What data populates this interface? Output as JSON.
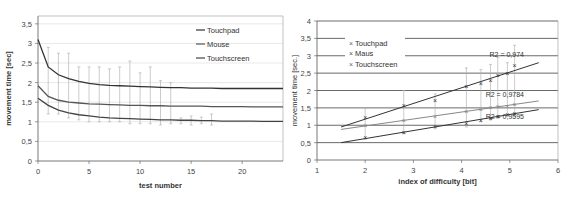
{
  "chart_data": [
    {
      "type": "line",
      "title": "",
      "xlabel": "test number",
      "ylabel": "movement time [sec]",
      "xlim": [
        0,
        24
      ],
      "ylim": [
        0,
        3.7
      ],
      "x_ticks": [
        "0",
        "5",
        "10",
        "15",
        "20"
      ],
      "y_ticks": [
        "0",
        "0,5",
        "1",
        "1,5",
        "2",
        "2,5",
        "3",
        "3,5"
      ],
      "grid": true,
      "legend_position": "top-right inside",
      "legend": [
        "Touchpad",
        "Mouse",
        "Touchscreen"
      ],
      "x": [
        0,
        1,
        2,
        3,
        4,
        5,
        6,
        7,
        8,
        9,
        10,
        11,
        12,
        13,
        14,
        15,
        16,
        17,
        18,
        19,
        20,
        21,
        22,
        23,
        24
      ],
      "series": [
        {
          "name": "Touchpad",
          "values": [
            3.1,
            2.4,
            2.2,
            2.1,
            2.03,
            1.98,
            1.95,
            1.93,
            1.92,
            1.91,
            1.9,
            1.89,
            1.88,
            1.87,
            1.87,
            1.86,
            1.86,
            1.86,
            1.85,
            1.85,
            1.85,
            1.85,
            1.85,
            1.85,
            1.85
          ]
        },
        {
          "name": "Mouse",
          "values": [
            1.92,
            1.65,
            1.55,
            1.5,
            1.48,
            1.46,
            1.45,
            1.44,
            1.43,
            1.42,
            1.42,
            1.41,
            1.41,
            1.4,
            1.4,
            1.4,
            1.4,
            1.39,
            1.39,
            1.39,
            1.39,
            1.38,
            1.38,
            1.38,
            1.38
          ]
        },
        {
          "name": "Touchscreen",
          "values": [
            1.6,
            1.42,
            1.3,
            1.23,
            1.18,
            1.15,
            1.12,
            1.1,
            1.09,
            1.08,
            1.07,
            1.06,
            1.05,
            1.05,
            1.04,
            1.04,
            1.03,
            1.03,
            1.02,
            1.02,
            1.02,
            1.02,
            1.01,
            1.01,
            1.01
          ]
        }
      ],
      "error_bars": [
        {
          "x": 1,
          "low": 1.2,
          "high": 2.9
        },
        {
          "x": 2,
          "low": 1.2,
          "high": 2.75
        },
        {
          "x": 3,
          "low": 1.1,
          "high": 2.75
        },
        {
          "x": 4,
          "low": 1.05,
          "high": 2.4
        },
        {
          "x": 5,
          "low": 1.0,
          "high": 2.4
        },
        {
          "x": 6,
          "low": 1.0,
          "high": 2.4
        },
        {
          "x": 7,
          "low": 1.0,
          "high": 2.35
        },
        {
          "x": 8,
          "low": 1.0,
          "high": 2.4
        },
        {
          "x": 9,
          "low": 0.95,
          "high": 2.55
        },
        {
          "x": 10,
          "low": 0.95,
          "high": 2.25
        },
        {
          "x": 11,
          "low": 0.95,
          "high": 2.4
        },
        {
          "x": 12,
          "low": 0.92,
          "high": 2.05
        },
        {
          "x": 13,
          "low": 0.95,
          "high": 2.0
        },
        {
          "x": 14,
          "low": 0.95,
          "high": 1.1
        },
        {
          "x": 15,
          "low": 0.92,
          "high": 1.15
        },
        {
          "x": 16,
          "low": 0.95,
          "high": 1.12
        },
        {
          "x": 17,
          "low": 0.92,
          "high": 1.2
        }
      ]
    },
    {
      "type": "scatter",
      "title": "",
      "xlabel": "index of difficulty [bit]",
      "ylabel": "movement time [sec.]",
      "xlim": [
        1,
        6
      ],
      "ylim": [
        0,
        4
      ],
      "x_ticks": [
        "1",
        "2",
        "3",
        "4",
        "5",
        "6"
      ],
      "y_ticks": [
        "0",
        "0,5",
        "1",
        "1,5",
        "2",
        "2,5",
        "3",
        "3,5",
        "4"
      ],
      "grid": true,
      "legend_position": "top-left inside",
      "legend": [
        "Touchpad",
        "Maus",
        "Touchscreen"
      ],
      "x": [
        2.0,
        2.8,
        3.45,
        4.1,
        4.4,
        4.6,
        4.75,
        4.95,
        5.1
      ],
      "series": [
        {
          "name": "Touchpad",
          "values": [
            1.22,
            1.58,
            1.72,
            2.12,
            2.2,
            2.3,
            2.42,
            2.48,
            2.72
          ],
          "trendline": {
            "x": [
              1.5,
              5.6
            ],
            "y": [
              0.95,
              2.8
            ]
          },
          "r2_label": "R2 = 0,974",
          "r2": 0.974
        },
        {
          "name": "Maus",
          "values": [
            0.98,
            1.15,
            1.25,
            1.4,
            1.45,
            1.5,
            1.55,
            1.55,
            1.6
          ],
          "trendline": {
            "x": [
              1.5,
              5.6
            ],
            "y": [
              0.88,
              1.7
            ]
          },
          "r2_label": "R2 = 0,9784",
          "r2": 0.9784
        },
        {
          "name": "Touchscreen",
          "values": [
            0.65,
            0.8,
            0.95,
            1.05,
            1.15,
            1.2,
            1.25,
            1.3,
            1.35
          ],
          "trendline": {
            "x": [
              1.5,
              5.6
            ],
            "y": [
              0.5,
              1.45
            ]
          },
          "r2_label": "R2 = 0,9595",
          "r2": 0.9595
        }
      ],
      "error_bars": [
        {
          "x": 2.0,
          "low": 0.6,
          "high": 1.5
        },
        {
          "x": 2.8,
          "low": 0.75,
          "high": 2.0
        },
        {
          "x": 3.45,
          "low": 0.9,
          "high": 1.9
        },
        {
          "x": 4.1,
          "low": 0.95,
          "high": 2.65
        },
        {
          "x": 4.4,
          "low": 1.1,
          "high": 2.6
        },
        {
          "x": 4.6,
          "low": 1.15,
          "high": 2.75
        },
        {
          "x": 4.75,
          "low": 1.2,
          "high": 2.95
        },
        {
          "x": 4.95,
          "low": 1.25,
          "high": 2.8
        },
        {
          "x": 5.1,
          "low": 1.25,
          "high": 3.3
        }
      ]
    }
  ]
}
